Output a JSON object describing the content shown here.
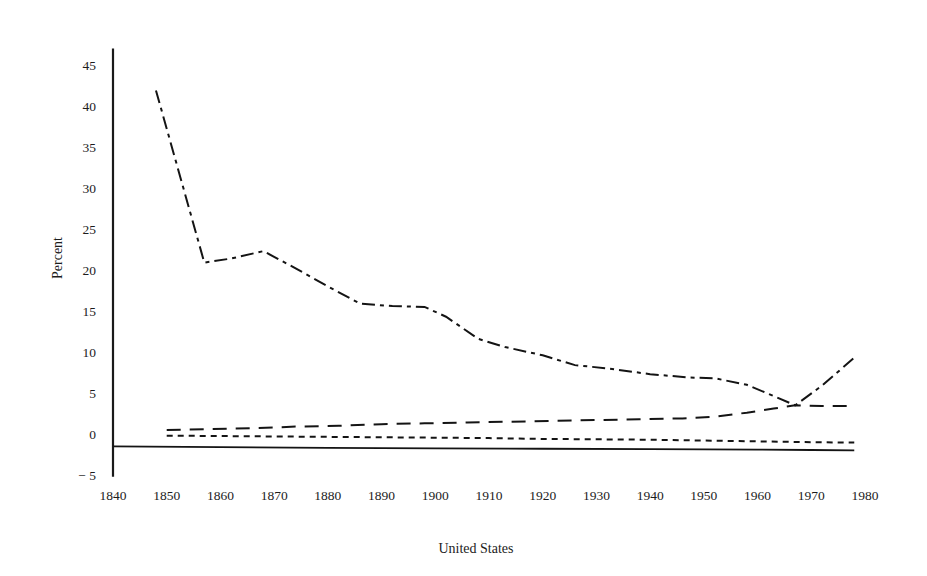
{
  "figure": {
    "background_color": "#ffffff",
    "ink_color": "#141414"
  },
  "chart_data": {
    "type": "line",
    "title": "",
    "subtitle": "",
    "xlabel": "United States",
    "ylabel": "Percent",
    "xlim": [
      1838,
      1884
    ],
    "ylim": [
      -5,
      47
    ],
    "xticks": [
      1840,
      1850,
      1860,
      1870,
      1880,
      1890,
      1900,
      1910,
      1920,
      1930,
      1940,
      1950,
      1960,
      1970,
      1980
    ],
    "xtick_labels": [
      "1840",
      "1850",
      "1860",
      "1870",
      "1880",
      "1890",
      "1900",
      "1910",
      "1920",
      "1930",
      "1940",
      "1950",
      "1960",
      "1970",
      "1980"
    ],
    "yticks": [
      -5,
      0,
      5,
      10,
      15,
      20,
      25,
      30,
      35,
      40,
      45
    ],
    "ytick_labels": [
      "− 5",
      "0",
      "5",
      "10",
      "15",
      "20",
      "25",
      "30",
      "35",
      "40",
      "45"
    ],
    "grid": false,
    "legend": "none",
    "axis_style": "left-spine-and-bottom-line",
    "series": [
      {
        "name": "series-dash-dot-upper",
        "style": "dash-dot",
        "dasharray": "13,5,4,5",
        "width": 2.0,
        "x": [
          1848,
          1857,
          1862,
          1868,
          1874,
          1880,
          1886,
          1892,
          1898,
          1902,
          1908,
          1913,
          1920,
          1926,
          1932,
          1940,
          1947,
          1952,
          1958,
          1962,
          1967,
          1972,
          1978
        ],
        "y": [
          41.9,
          20.9,
          21.4,
          22.3,
          20.2,
          18.0,
          15.9,
          15.6,
          15.5,
          14.3,
          11.6,
          10.6,
          9.6,
          8.4,
          8.0,
          7.3,
          6.9,
          6.8,
          6.0,
          4.9,
          3.5,
          5.9,
          9.3
        ]
      },
      {
        "name": "series-long-dash-lower",
        "style": "dashed",
        "dasharray": "14,9",
        "width": 2.0,
        "x": [
          1850,
          1858,
          1866,
          1874,
          1882,
          1890,
          1898,
          1906,
          1914,
          1922,
          1930,
          1938,
          1946,
          1952,
          1958,
          1963,
          1967,
          1972,
          1978
        ],
        "y": [
          0.5,
          0.6,
          0.7,
          0.9,
          1.0,
          1.2,
          1.3,
          1.4,
          1.5,
          1.6,
          1.7,
          1.8,
          1.9,
          2.1,
          2.6,
          3.1,
          3.5,
          3.4,
          3.4
        ]
      },
      {
        "name": "series-short-dash-lower",
        "style": "dotted",
        "dasharray": "6,5",
        "width": 2.0,
        "x": [
          1850,
          1860,
          1870,
          1880,
          1890,
          1900,
          1910,
          1920,
          1930,
          1940,
          1950,
          1960,
          1970,
          1978
        ],
        "y": [
          -0.2,
          -0.25,
          -0.3,
          -0.35,
          -0.4,
          -0.45,
          -0.5,
          -0.6,
          -0.65,
          -0.7,
          -0.8,
          -0.9,
          -1.0,
          -1.05
        ]
      },
      {
        "name": "series-solid-baseline",
        "style": "solid",
        "dasharray": "none",
        "width": 1.8,
        "x": [
          1840,
          1860,
          1880,
          1900,
          1920,
          1940,
          1960,
          1970,
          1978
        ],
        "y": [
          -1.5,
          -1.6,
          -1.7,
          -1.75,
          -1.8,
          -1.85,
          -1.9,
          -1.95,
          -2.0
        ]
      }
    ]
  }
}
